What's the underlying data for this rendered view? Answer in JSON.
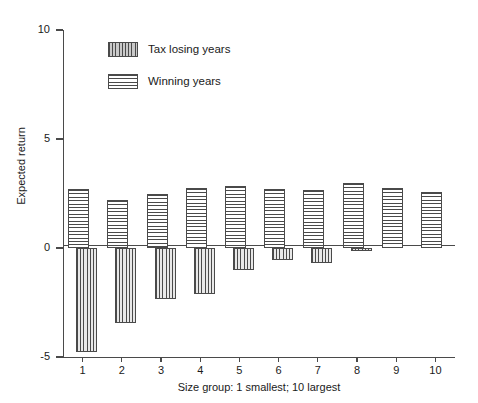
{
  "chart_data": {
    "type": "bar",
    "title": "",
    "xlabel": "Size group: 1 smallest; 10 largest",
    "ylabel": "Expected return",
    "categories": [
      "1",
      "2",
      "3",
      "4",
      "5",
      "6",
      "7",
      "8",
      "9",
      "10"
    ],
    "ylim": [
      -5,
      10
    ],
    "yticks": [
      10,
      5,
      0,
      -5
    ],
    "ytick_labels": [
      "10",
      "5",
      "0",
      "-5"
    ],
    "grid": false,
    "legend_position": "top-center",
    "series": [
      {
        "name": "Tax losing years",
        "pattern": "vertical-hatch",
        "values": [
          -4.75,
          -3.45,
          -2.35,
          -2.1,
          -1.0,
          -0.55,
          -0.7,
          -0.15,
          0,
          0
        ]
      },
      {
        "name": "Winning years",
        "pattern": "horizontal-hatch",
        "values": [
          2.7,
          2.2,
          2.5,
          2.75,
          2.85,
          2.7,
          2.65,
          3.0,
          2.75,
          2.55
        ]
      }
    ]
  },
  "legend": {
    "items": [
      {
        "label": "Tax losing years",
        "pattern": "losing"
      },
      {
        "label": "Winning years",
        "pattern": "winning"
      }
    ]
  },
  "colors": {
    "axis": "#4a4a4a",
    "background": "#ffffff",
    "ink": "#1a1a1a"
  }
}
